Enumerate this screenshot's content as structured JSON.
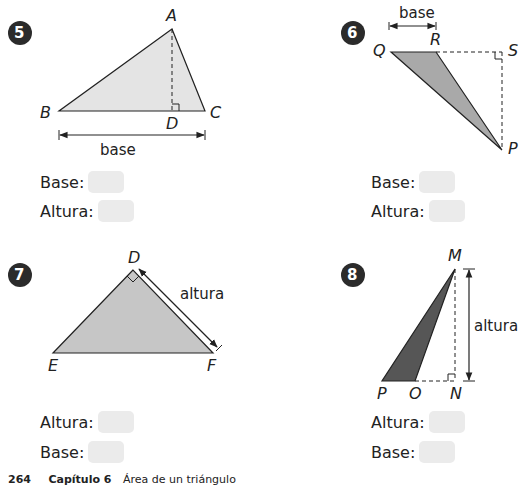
{
  "problems": [
    {
      "number": "5",
      "vertices": {
        "A": "A",
        "B": "B",
        "C": "C",
        "D": "D"
      },
      "annotation": "base",
      "fields": [
        {
          "label": "Base:",
          "value": ""
        },
        {
          "label": "Altura:",
          "value": ""
        }
      ],
      "fill_color": "#e4e4e4"
    },
    {
      "number": "6",
      "vertices": {
        "Q": "Q",
        "R": "R",
        "S": "S",
        "P": "P"
      },
      "annotation": "base",
      "fields": [
        {
          "label": "Base:",
          "value": ""
        },
        {
          "label": "Altura:",
          "value": ""
        }
      ],
      "fill_color": "#a9a9a9"
    },
    {
      "number": "7",
      "vertices": {
        "D": "D",
        "E": "E",
        "F": "F"
      },
      "annotation": "altura",
      "fields": [
        {
          "label": "Altura:",
          "value": ""
        },
        {
          "label": "Base:",
          "value": ""
        }
      ],
      "fill_color": "#c6c6c6"
    },
    {
      "number": "8",
      "vertices": {
        "M": "M",
        "P": "P",
        "O": "O",
        "N": "N"
      },
      "annotation": "altura",
      "fields": [
        {
          "label": "Altura:",
          "value": ""
        },
        {
          "label": "Base:",
          "value": ""
        }
      ],
      "fill_color": "#565656"
    }
  ],
  "footer": {
    "page_number": "264",
    "chapter": "Capítulo 6",
    "title": "Área de un triángulo"
  },
  "colors": {
    "badge": "#2b2b2b",
    "answer_box": "#ebebeb",
    "line": "#222222"
  }
}
